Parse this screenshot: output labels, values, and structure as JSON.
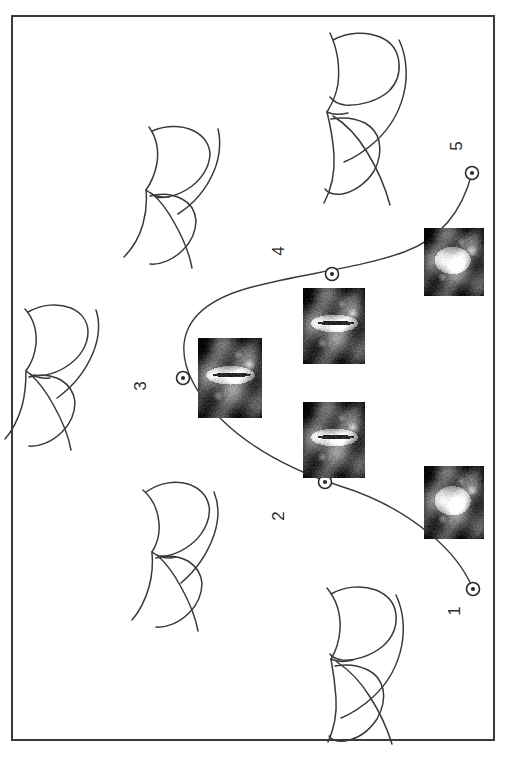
{
  "figure": {
    "orientation": "rotated-90-ccw",
    "border_color": "#3a3a3a",
    "background_color": "#ffffff",
    "line_color": "#3a3a3a",
    "caption": ""
  },
  "stage_labels": [
    {
      "id": "1",
      "text": "1",
      "x": 444,
      "y": 600
    },
    {
      "id": "2",
      "text": "2",
      "x": 268,
      "y": 505
    },
    {
      "id": "3",
      "text": "3",
      "x": 130,
      "y": 375
    },
    {
      "id": "4",
      "text": "4",
      "x": 268,
      "y": 240
    },
    {
      "id": "5",
      "text": "5",
      "x": 446,
      "y": 135
    }
  ],
  "vocal_fold_sketches": [
    {
      "id": "sketch-1",
      "label": "1",
      "cx": 372,
      "cy": 648
    },
    {
      "id": "sketch-2",
      "label": "2",
      "cx": 188,
      "cy": 548
    },
    {
      "id": "sketch-3",
      "label": "3",
      "cx": 62,
      "cy": 372
    },
    {
      "id": "sketch-4",
      "label": "4",
      "cx": 186,
      "cy": 180
    },
    {
      "id": "sketch-5",
      "label": "5",
      "cx": 368,
      "cy": 100
    }
  ],
  "trajectory": {
    "description": "glottal-cycle-trajectory-curve",
    "stroke": "#3a3a3a",
    "stroke_width": 1.4,
    "path": "M 473 589 C 466 572 452 552 430 534 C 400 509 366 494 340 486 C 300 473 255 452 222 420 C 196 394 182 368 184 344 C 187 315 214 297 252 287 C 300 274 360 268 404 252 C 440 239 462 212 472 173"
  },
  "markers": [
    {
      "id": "marker-1",
      "stage": "1",
      "x": 473,
      "y": 589,
      "outer_r": 6.5,
      "inner_r": 2.1
    },
    {
      "id": "marker-2",
      "stage": "2",
      "x": 325,
      "y": 482,
      "outer_r": 6.5,
      "inner_r": 2.1
    },
    {
      "id": "marker-3",
      "stage": "3",
      "x": 183,
      "y": 378,
      "outer_r": 6.5,
      "inner_r": 2.1
    },
    {
      "id": "marker-4",
      "stage": "4",
      "x": 332,
      "y": 274,
      "outer_r": 6.5,
      "inner_r": 2.1
    },
    {
      "id": "marker-5",
      "stage": "5",
      "x": 472,
      "y": 173,
      "outer_r": 6.5,
      "inner_r": 2.1
    }
  ],
  "endoscopic_photos": [
    {
      "id": "photo-1",
      "stage": "1",
      "x": 424,
      "y": 466,
      "w": 60,
      "h": 73,
      "glottis_opening": "wide-open",
      "alt": "laryngoscopic image of open glottis"
    },
    {
      "id": "photo-2",
      "stage": "2",
      "x": 303,
      "y": 402,
      "w": 62,
      "h": 76,
      "glottis_opening": "narrow-slit",
      "alt": "laryngoscopic image of narrow glottal slit"
    },
    {
      "id": "photo-3",
      "stage": "3",
      "x": 198,
      "y": 338,
      "w": 64,
      "h": 80,
      "glottis_opening": "narrow-slit",
      "alt": "laryngoscopic image of narrow glottal slit"
    },
    {
      "id": "photo-4",
      "stage": "4",
      "x": 303,
      "y": 288,
      "w": 62,
      "h": 76,
      "glottis_opening": "narrow-slit",
      "alt": "laryngoscopic image of narrow glottal slit"
    },
    {
      "id": "photo-5",
      "stage": "5",
      "x": 424,
      "y": 228,
      "w": 60,
      "h": 68,
      "glottis_opening": "wide-open",
      "alt": "laryngoscopic image of open glottis"
    }
  ],
  "chart_data": {
    "type": "scatter",
    "title": "",
    "xlabel": "",
    "ylabel": "",
    "categories": [
      "1",
      "2",
      "3",
      "4",
      "5"
    ],
    "values": [
      1,
      2,
      3,
      4,
      5
    ],
    "annotations": [
      "1",
      "2",
      "3",
      "4",
      "5"
    ],
    "legend": []
  }
}
